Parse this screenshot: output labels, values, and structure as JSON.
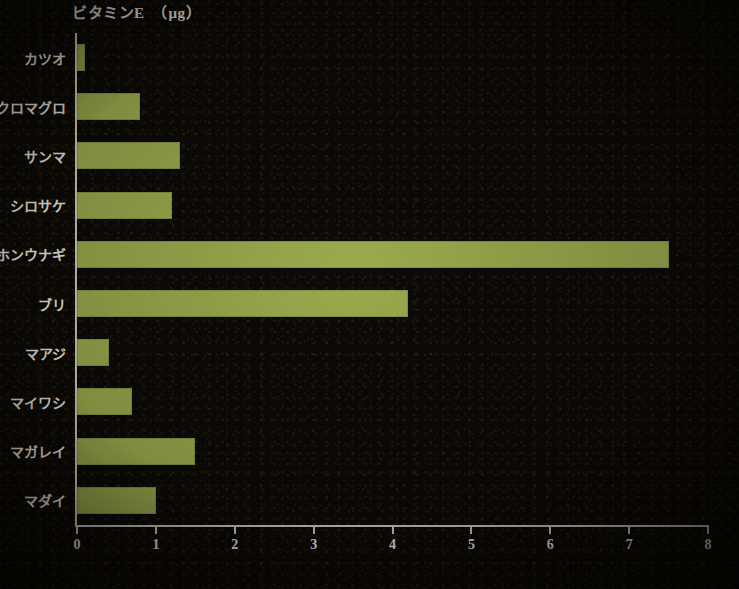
{
  "chart_data": {
    "type": "bar",
    "orientation": "horizontal",
    "title": "ビタミンE　（μg）",
    "xlabel": "",
    "ylabel": "",
    "xlim": [
      0,
      8
    ],
    "xticks": [
      "0",
      "1",
      "2",
      "3",
      "4",
      "5",
      "6",
      "7",
      "8"
    ],
    "grid": false,
    "legend": null,
    "bar_color": "#9aac4d",
    "axis_color": "#cfcabc",
    "text_color": "#efeade",
    "background_color": "#0c0a06",
    "categories": [
      "カツオ",
      "クロマグロ",
      "サンマ",
      "シロサケ",
      "ホンウナギ",
      "ブリ",
      "マアジ",
      "マイワシ",
      "マガレイ",
      "マダイ"
    ],
    "values": [
      0.1,
      0.8,
      1.3,
      1.2,
      7.5,
      4.2,
      0.4,
      0.7,
      1.5,
      1.0
    ]
  }
}
